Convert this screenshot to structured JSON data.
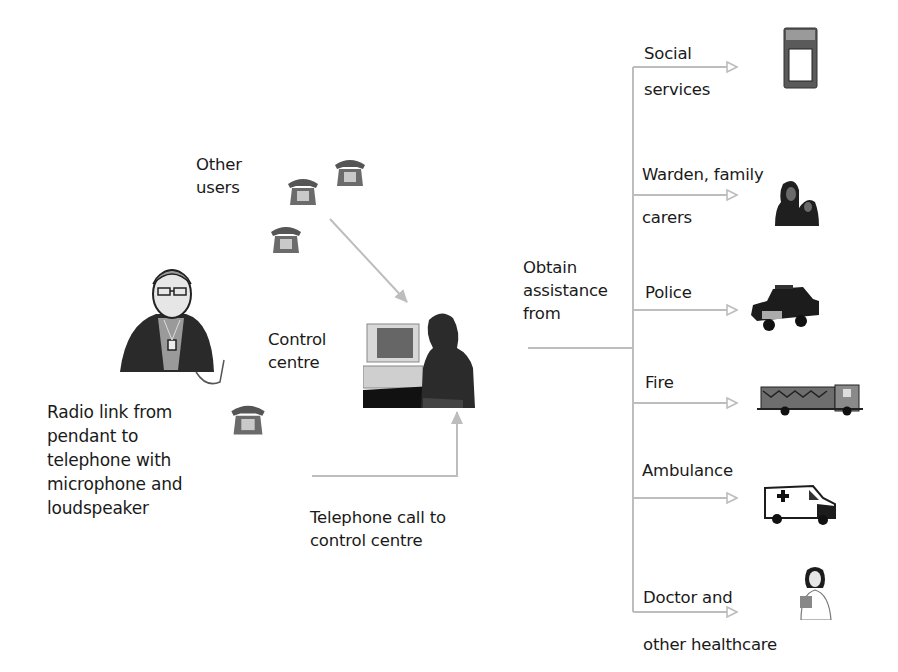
{
  "diagram": {
    "title": "",
    "colors": {
      "arrow": "#bdbdbd",
      "text": "#1a1a1a",
      "clipart_dark": "#1e1e1e",
      "clipart_mid": "#7a7a7a"
    }
  },
  "nodes": {
    "other_users": {
      "line1": "Other",
      "line2": "users",
      "icon": "telephone-icon"
    },
    "user": {
      "icon": "elderly-man-with-pendant-icon"
    },
    "radio_link": {
      "line1": "Radio link from",
      "line2": "pendant to",
      "line3": "telephone with",
      "line4": "microphone and",
      "line5": "loudspeaker",
      "icon": "telephone-icon"
    },
    "control_centre": {
      "line1": "Control",
      "line2": "centre",
      "icon": "operator-at-computer-icon"
    },
    "telephone_call": {
      "line1": "Telephone call to",
      "line2": "control centre"
    },
    "obtain": {
      "line1": "Obtain",
      "line2": "assistance",
      "line3": "from"
    }
  },
  "services": [
    {
      "line1": "Social",
      "line2": "services",
      "icon": "mobile-phone-icon"
    },
    {
      "line1": "Warden, family",
      "line2": "carers",
      "icon": "family-group-icon"
    },
    {
      "line1": "Police",
      "line2": "",
      "icon": "police-car-icon"
    },
    {
      "line1": "Fire",
      "line2": "",
      "icon": "fire-engine-icon"
    },
    {
      "line1": "Ambulance",
      "line2": "",
      "icon": "ambulance-icon"
    },
    {
      "line1": "Doctor and",
      "line2": "other healthcare",
      "icon": "doctor-icon"
    }
  ]
}
